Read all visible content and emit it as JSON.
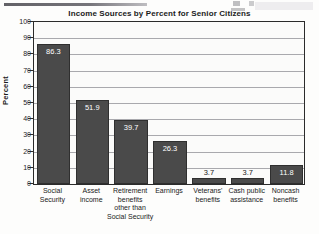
{
  "chart_data": {
    "type": "bar",
    "title": "Income Sources by Percent for Senior Citizens",
    "xlabel": "",
    "ylabel": "Percent",
    "ylim": [
      0,
      100
    ],
    "ytick_step": 10,
    "yticks": [
      "100",
      "90",
      "80",
      "70",
      "60",
      "50",
      "40",
      "30",
      "20",
      "10",
      "0"
    ],
    "grid": true,
    "legend": false,
    "categories": [
      "Social Security",
      "Asset income",
      "Retirement benefits other than Social Security",
      "Earnings",
      "Veterans' benefits",
      "Cash public assistance",
      "Noncash benefits"
    ],
    "category_lines": [
      [
        "Social",
        "Security"
      ],
      [
        "Asset",
        "income"
      ],
      [
        "Retirement",
        "benefits",
        "other than",
        "Social Security"
      ],
      [
        "Earnings"
      ],
      [
        "Veterans'",
        "benefits"
      ],
      [
        "Cash public",
        "assistance"
      ],
      [
        "Noncash",
        "benefits"
      ]
    ],
    "values": [
      86.3,
      51.9,
      39.7,
      26.3,
      3.7,
      3.7,
      11.8
    ],
    "value_labels": [
      "86.3",
      "51.9",
      "39.7",
      "26.3",
      "3.7",
      "3.7",
      "11.8"
    ],
    "bar_color": "#4a4a4a",
    "bar_border_color": "#2f2f2f",
    "plot_background": "#fbfbfa",
    "gridline_color": "#a9a9ad",
    "frame_color": "#2b2b2b",
    "inside_label_color": "#ffffff",
    "outside_label_color": "#1b1b1b"
  }
}
